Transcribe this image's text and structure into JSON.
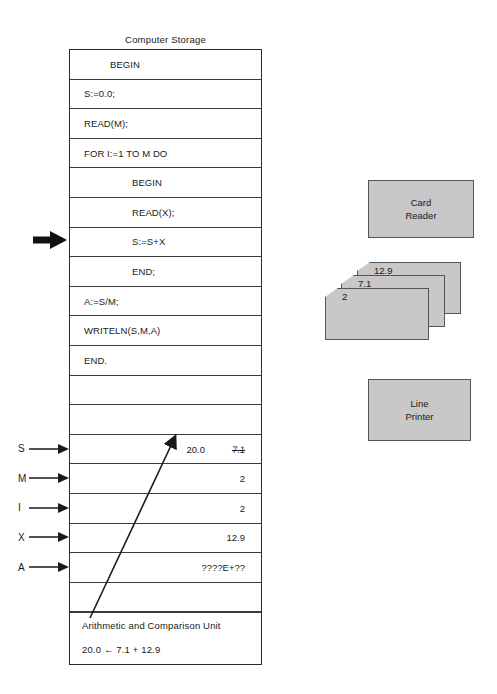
{
  "storage": {
    "title": "Computer Storage",
    "code_rows": [
      {
        "text": "BEGIN",
        "indent": 1
      },
      {
        "text": "S:=0.0;",
        "indent": 0
      },
      {
        "text": "READ(M);",
        "indent": 0
      },
      {
        "text": "FOR I:=1 TO M DO",
        "indent": 0
      },
      {
        "text": "BEGIN",
        "indent": 2
      },
      {
        "text": "READ(X);",
        "indent": 2
      },
      {
        "text": "S:=S+X",
        "indent": 2
      },
      {
        "text": "END;",
        "indent": 2
      },
      {
        "text": "A:=S/M;",
        "indent": 0
      },
      {
        "text": "WRITELN(S,M,A)",
        "indent": 0
      },
      {
        "text": "END.",
        "indent": 0
      }
    ],
    "blank_rows_before_vars": 2,
    "variables": [
      {
        "label": "S",
        "value": "7.1",
        "struck": true,
        "new_value": "20.0"
      },
      {
        "label": "M",
        "value": "2",
        "struck": false,
        "new_value": ""
      },
      {
        "label": "I",
        "value": "2",
        "struck": false,
        "new_value": ""
      },
      {
        "label": "X",
        "value": "12.9",
        "struck": false,
        "new_value": ""
      },
      {
        "label": "A",
        "value": "????E+??",
        "struck": false,
        "new_value": ""
      }
    ],
    "blank_rows_after_vars": 1,
    "acu": {
      "label": "Arithmetic and Comparison Unit",
      "expression": "20.0 ← 7.1 + 12.9"
    }
  },
  "devices": {
    "card_reader": {
      "line1": "Card",
      "line2": "Reader"
    },
    "line_printer": {
      "line1": "Line",
      "line2": "Printer"
    },
    "cards": [
      {
        "value": "12.9"
      },
      {
        "value": "7.1"
      },
      {
        "value": "2"
      }
    ]
  },
  "colors": {
    "device_fill": "#c8c8c8",
    "device_stroke": "#555555",
    "line": "#2b2b2b",
    "text": "#1a1a1a"
  }
}
